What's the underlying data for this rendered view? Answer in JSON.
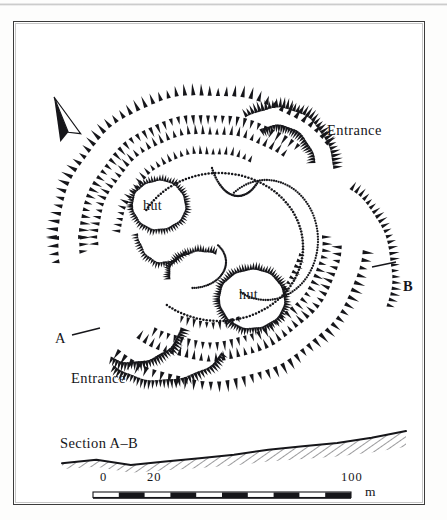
{
  "figure": {
    "type": "archaeological-site-plan",
    "labels": {
      "entrance_ne": "Entrance",
      "entrance_sw": "Entrance",
      "hut_1": "hut",
      "hut_2": "hut",
      "section_marker_a": "A",
      "section_marker_b": "B",
      "section_title": "Section A–B"
    },
    "north_arrow": {
      "name": "north-arrow",
      "bearing_deg": -20
    },
    "scale_bar": {
      "unit": "m",
      "tick_labels": [
        "0",
        "20",
        "100"
      ],
      "tick_values": [
        0,
        20,
        100
      ],
      "max_value": 100,
      "segments": 10,
      "segment_length": 10
    },
    "colors": {
      "ink": "#16161a",
      "frame": "#3b3b3b",
      "paper": "#ffffff",
      "page": "#fdfdfc"
    }
  },
  "chart_data": {
    "type": "line",
    "title": "Section A–B",
    "xlabel": "",
    "ylabel": "",
    "x": [
      0,
      10,
      20,
      30,
      40,
      50,
      60,
      70,
      80,
      90,
      100
    ],
    "values": [
      4,
      6,
      3,
      5,
      7,
      9,
      12,
      14,
      16,
      19,
      23
    ],
    "xlim": [
      0,
      100
    ],
    "ylim": [
      0,
      26
    ],
    "grid": false,
    "legend": "none",
    "annotations": [
      "Section A–B",
      "0",
      "20",
      "100",
      "m"
    ]
  }
}
